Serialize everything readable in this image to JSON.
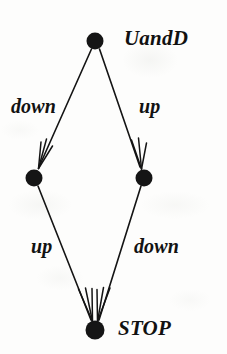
{
  "diagram": {
    "background_color": "#fdfdfc",
    "ink_color": "#141414",
    "nodes": [
      {
        "id": "uandd",
        "label": "UandD",
        "x": 95,
        "y": 41,
        "radius": 8,
        "label_position": "right"
      },
      {
        "id": "left",
        "label": "",
        "x": 34,
        "y": 178,
        "radius": 8,
        "label_position": "none"
      },
      {
        "id": "right",
        "label": "",
        "x": 144,
        "y": 178,
        "radius": 8,
        "label_position": "none"
      },
      {
        "id": "stop",
        "label": "STOP",
        "x": 95,
        "y": 330,
        "radius": 9,
        "label_position": "right"
      }
    ],
    "edges": [
      {
        "id": "edge-down-upper",
        "label": "down",
        "from": "uandd",
        "to": "left",
        "label_x": 11,
        "label_y": 96
      },
      {
        "id": "edge-up-upper",
        "label": "up",
        "from": "uandd",
        "to": "right",
        "label_x": 139,
        "label_y": 96
      },
      {
        "id": "edge-up-lower",
        "label": "up",
        "from": "left",
        "to": "stop",
        "label_x": 31,
        "label_y": 236
      },
      {
        "id": "edge-down-lower",
        "label": "down",
        "from": "right",
        "to": "stop",
        "label_x": 134,
        "label_y": 236
      }
    ]
  }
}
